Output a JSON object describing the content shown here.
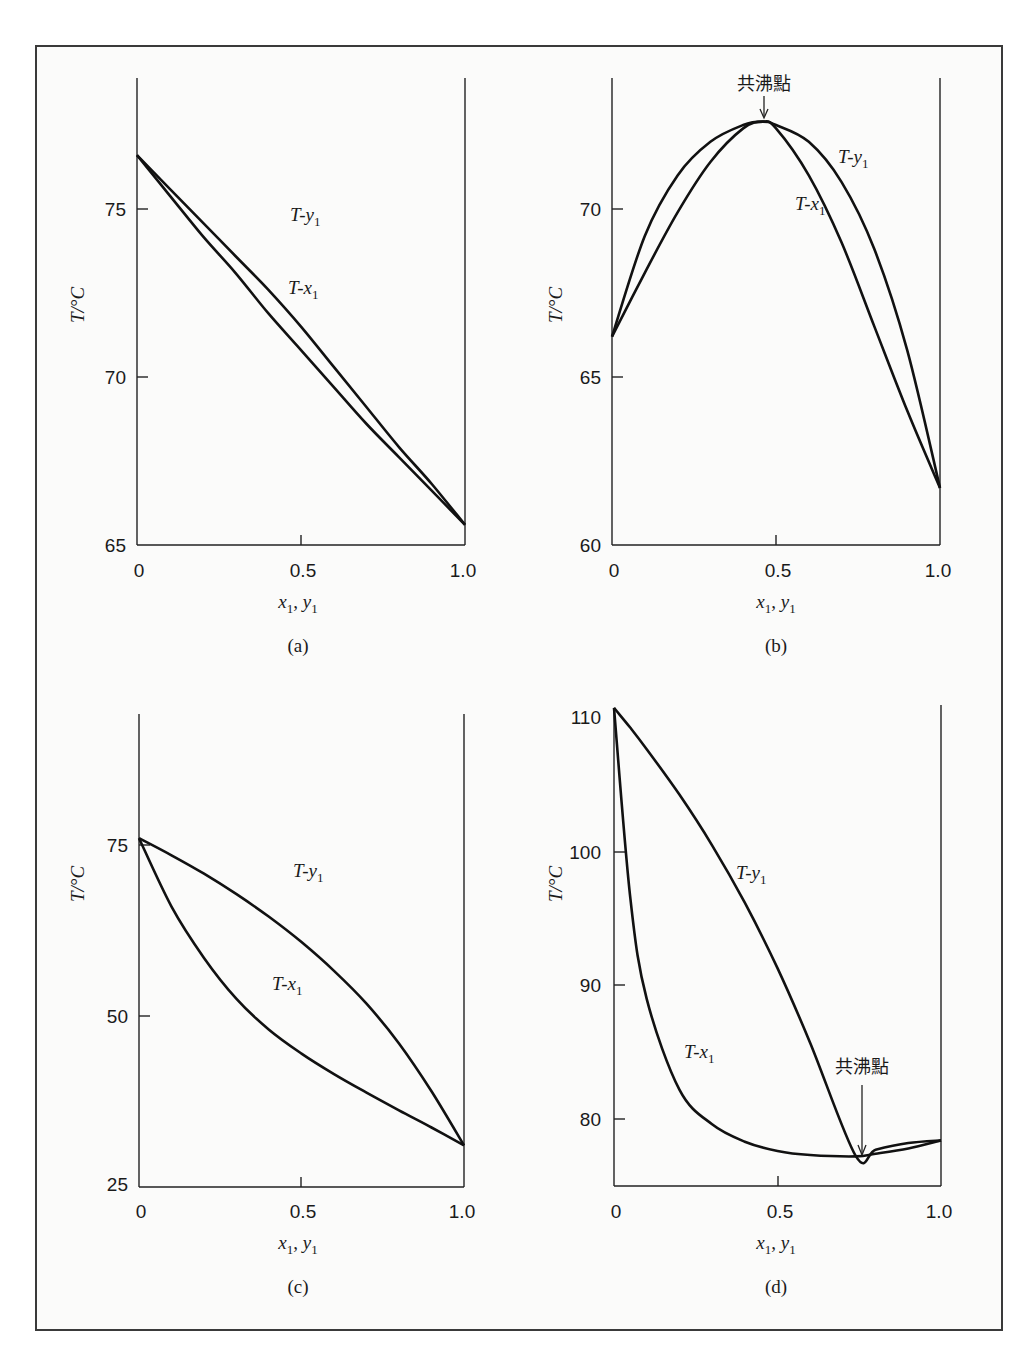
{
  "figure": {
    "panels": [
      {
        "id": "a",
        "caption": "(a)",
        "ylabel": "T/°C",
        "xlabel": "x1, y1",
        "xticks": [
          "0",
          "0.5",
          "1.0"
        ],
        "yticks": [
          "65",
          "70",
          "75"
        ],
        "curve_labels": {
          "vapor": "T-y1",
          "liquid": "T-x1"
        }
      },
      {
        "id": "b",
        "caption": "(b)",
        "ylabel": "T/°C",
        "xlabel": "x1, y1",
        "xticks": [
          "0",
          "0.5",
          "1.0"
        ],
        "yticks": [
          "60",
          "65",
          "70"
        ],
        "curve_labels": {
          "vapor": "T-y1",
          "liquid": "T-x1"
        },
        "annotation": "共沸點"
      },
      {
        "id": "c",
        "caption": "(c)",
        "ylabel": "T/°C",
        "xlabel": "x1, y1",
        "xticks": [
          "0",
          "0.5",
          "1.0"
        ],
        "yticks": [
          "25",
          "50",
          "75"
        ],
        "curve_labels": {
          "vapor": "T-y1",
          "liquid": "T-x1"
        }
      },
      {
        "id": "d",
        "caption": "(d)",
        "ylabel": "T/°C",
        "xlabel": "x1, y1",
        "xticks": [
          "0",
          "0.5",
          "1.0"
        ],
        "yticks": [
          "80",
          "90",
          "100",
          "110"
        ],
        "curve_labels": {
          "vapor": "T-y1",
          "liquid": "T-x1"
        },
        "annotation": "共沸點"
      }
    ]
  },
  "chart_data": [
    {
      "type": "line",
      "title": "(a)",
      "xlabel": "x1, y1",
      "ylabel": "T/°C",
      "xlim": [
        0,
        1.0
      ],
      "ylim": [
        65,
        78
      ],
      "xticks": [
        0,
        0.5,
        1.0
      ],
      "yticks": [
        65,
        70,
        75
      ],
      "grid": false,
      "x": [
        0,
        0.1,
        0.2,
        0.3,
        0.4,
        0.5,
        0.6,
        0.7,
        0.8,
        0.9,
        1.0
      ],
      "series": [
        {
          "name": "T-x1",
          "values": [
            76.6,
            75.4,
            74.2,
            73.1,
            71.9,
            70.8,
            69.7,
            68.6,
            67.6,
            66.6,
            65.6
          ]
        },
        {
          "name": "T-y1",
          "values": [
            76.6,
            75.6,
            74.6,
            73.6,
            72.6,
            71.5,
            70.3,
            69.1,
            67.9,
            66.8,
            65.6
          ]
        }
      ]
    },
    {
      "type": "line",
      "title": "(b)",
      "xlabel": "x1, y1",
      "ylabel": "T/°C",
      "xlim": [
        0,
        1.0
      ],
      "ylim": [
        60,
        74
      ],
      "xticks": [
        0,
        0.5,
        1.0
      ],
      "yticks": [
        60,
        65,
        70
      ],
      "grid": false,
      "annotations": [
        {
          "text": "共沸點",
          "x": 0.46,
          "y": 72.6,
          "meaning": "maximum-boiling azeotrope"
        }
      ],
      "x": [
        0,
        0.1,
        0.2,
        0.3,
        0.4,
        0.46,
        0.5,
        0.6,
        0.7,
        0.8,
        0.9,
        1.0
      ],
      "series": [
        {
          "name": "T-x1",
          "values": [
            66.2,
            68.1,
            69.9,
            71.4,
            72.4,
            72.6,
            72.4,
            71.0,
            69.0,
            66.5,
            64.0,
            61.7
          ]
        },
        {
          "name": "T-y1",
          "values": [
            66.2,
            69.2,
            71.0,
            72.0,
            72.5,
            72.6,
            72.5,
            72.0,
            70.8,
            68.8,
            65.8,
            61.7
          ]
        }
      ]
    },
    {
      "type": "line",
      "title": "(c)",
      "xlabel": "x1, y1",
      "ylabel": "T/°C",
      "xlim": [
        0,
        1.0
      ],
      "ylim": [
        25,
        94
      ],
      "xticks": [
        0,
        0.5,
        1.0
      ],
      "yticks": [
        25,
        50,
        75
      ],
      "grid": false,
      "x": [
        0,
        0.1,
        0.2,
        0.3,
        0.4,
        0.5,
        0.6,
        0.7,
        0.8,
        0.9,
        1.0
      ],
      "series": [
        {
          "name": "T-x1",
          "values": [
            76.0,
            66.0,
            58.5,
            52.5,
            48.0,
            44.5,
            41.5,
            38.8,
            36.2,
            33.7,
            31.1
          ]
        },
        {
          "name": "T-y1",
          "values": [
            76.0,
            73.5,
            70.8,
            67.8,
            64.5,
            60.8,
            56.6,
            51.8,
            46.0,
            39.0,
            31.1
          ]
        }
      ]
    },
    {
      "type": "line",
      "title": "(d)",
      "xlabel": "x1, y1",
      "ylabel": "T/°C",
      "xlim": [
        0,
        1.0
      ],
      "ylim": [
        75,
        110.8
      ],
      "xticks": [
        0,
        0.5,
        1.0
      ],
      "yticks": [
        80,
        90,
        100,
        110
      ],
      "grid": false,
      "annotations": [
        {
          "text": "共沸點",
          "x": 0.74,
          "y": 77.2,
          "meaning": "minimum-boiling azeotrope"
        }
      ],
      "x": [
        0,
        0.05,
        0.1,
        0.2,
        0.3,
        0.4,
        0.5,
        0.6,
        0.74,
        0.8,
        0.9,
        1.0
      ],
      "series": [
        {
          "name": "T-x1",
          "values": [
            110.8,
            96.5,
            89.0,
            82.2,
            79.6,
            78.3,
            77.6,
            77.3,
            77.2,
            77.4,
            77.8,
            78.4
          ]
        },
        {
          "name": "T-y1",
          "values": [
            110.8,
            109.3,
            107.7,
            104.3,
            100.5,
            96.2,
            91.3,
            85.7,
            77.2,
            77.7,
            78.2,
            78.4
          ]
        }
      ]
    }
  ]
}
